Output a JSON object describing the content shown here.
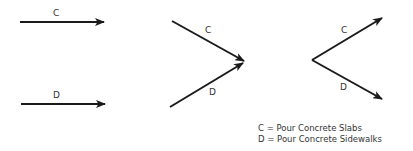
{
  "diagram": {
    "panels": [
      {
        "name": "parallel",
        "arrows": [
          {
            "label": "C",
            "from": [
              20,
              22
            ],
            "to": [
              104,
              22
            ]
          },
          {
            "label": "D",
            "from": [
              21,
              104
            ],
            "to": [
              105,
              104
            ]
          }
        ]
      },
      {
        "name": "merge",
        "arrows": [
          {
            "label": "C",
            "from": [
              172,
              21
            ],
            "to": [
              244,
              61
            ]
          },
          {
            "label": "D",
            "from": [
              170,
              107
            ],
            "to": [
              243,
              63
            ]
          }
        ]
      },
      {
        "name": "burst",
        "arrows": [
          {
            "label": "C",
            "from": [
              312,
              60
            ],
            "to": [
              382,
              18
            ]
          },
          {
            "label": "D",
            "from": [
              312,
              60
            ],
            "to": [
              382,
              99
            ]
          }
        ]
      }
    ],
    "legend": [
      {
        "key": "C",
        "text": "C = Pour Concrete Slabs"
      },
      {
        "key": "D",
        "text": "D = Pour Concrete Sidewalks"
      }
    ]
  }
}
